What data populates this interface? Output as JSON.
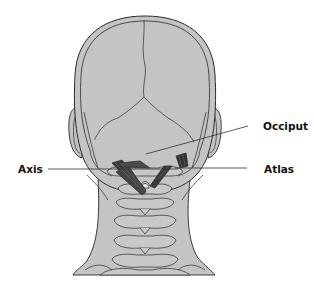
{
  "figure": {
    "colors": {
      "background": "#ffffff",
      "skin_fill": "#c4c4c4",
      "outline": "#2a2a2a",
      "muscle": "#3a3a3a",
      "leader_line": "#333333"
    }
  },
  "labels": {
    "occiput": "Occiput",
    "axis": "Axis",
    "atlas": "Atlas"
  }
}
